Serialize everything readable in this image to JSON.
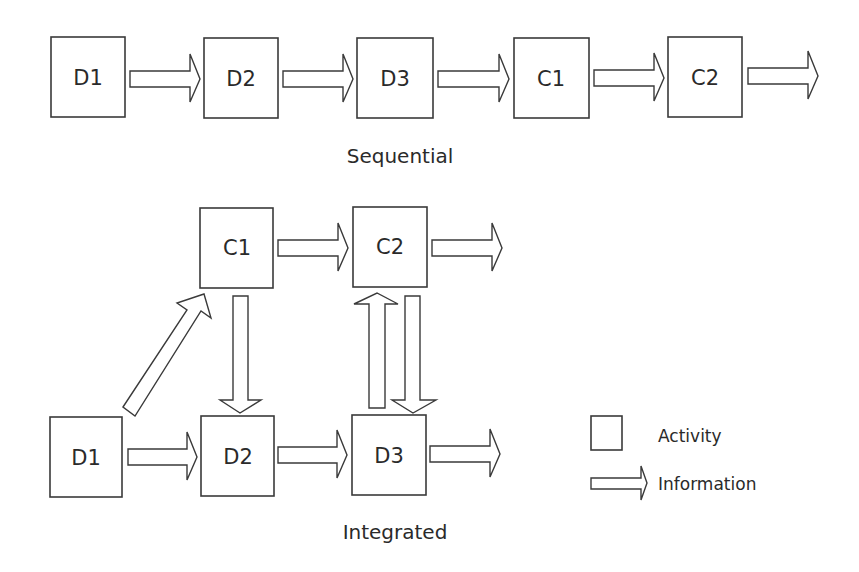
{
  "sequential": {
    "caption": "Sequential",
    "boxes": [
      {
        "label": "D1"
      },
      {
        "label": "D2"
      },
      {
        "label": "D3"
      },
      {
        "label": "C1"
      },
      {
        "label": "C2"
      }
    ]
  },
  "integrated": {
    "caption": "Integrated",
    "top_row": [
      {
        "label": "C1"
      },
      {
        "label": "C2"
      }
    ],
    "bottom_row": [
      {
        "label": "D1"
      },
      {
        "label": "D2"
      },
      {
        "label": "D3"
      }
    ]
  },
  "legend": {
    "activity_label": "Activity",
    "information_label": "Information"
  },
  "colors": {
    "stroke": "#3a3a3a",
    "fill": "#ffffff",
    "text": "#2a2a2a"
  }
}
